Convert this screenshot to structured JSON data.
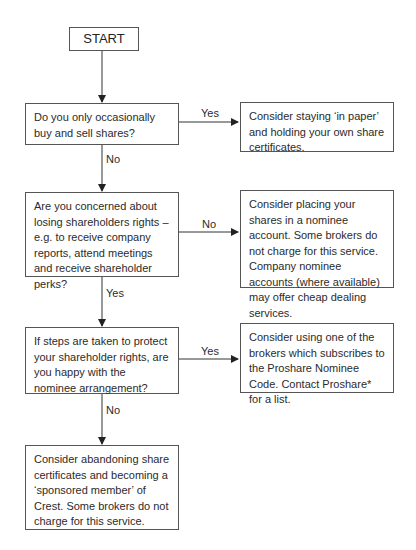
{
  "diagram": {
    "start": {
      "label": "START"
    },
    "questions": [
      {
        "id": "q1",
        "text": "Do you only occasionally buy and sell shares?"
      },
      {
        "id": "q2",
        "text": "Are you concerned about losing shareholders rights – e.g. to receive company reports, attend meetings and receive shareholder perks?"
      },
      {
        "id": "q3",
        "text": "If steps are taken to protect your shareholder rights, are you happy with the nominee arrangement?"
      }
    ],
    "outcomes": [
      {
        "id": "o1",
        "text": "Consider staying ‘in paper’ and holding your own share certificates."
      },
      {
        "id": "o2",
        "text": "Consider placing your shares in a nominee account. Some brokers do not charge for this service. Company nominee accounts (where available) may offer cheap dealing services."
      },
      {
        "id": "o3",
        "text": "Consider using one of the brokers which subscribes to the Proshare Nominee Code. Contact Proshare* for a list."
      },
      {
        "id": "o4",
        "text": "Consider abandoning share certificates and becoming a ‘sponsored member’ of Crest. Some brokers do not charge for this service."
      }
    ],
    "edges": [
      {
        "from": "start",
        "to": "q1",
        "label": ""
      },
      {
        "from": "q1",
        "to": "o1",
        "label": "Yes"
      },
      {
        "from": "q1",
        "to": "q2",
        "label": "No"
      },
      {
        "from": "q2",
        "to": "o2",
        "label": "No"
      },
      {
        "from": "q2",
        "to": "q3",
        "label": "Yes"
      },
      {
        "from": "q3",
        "to": "o3",
        "label": "Yes"
      },
      {
        "from": "q3",
        "to": "o4",
        "label": "No"
      }
    ]
  }
}
